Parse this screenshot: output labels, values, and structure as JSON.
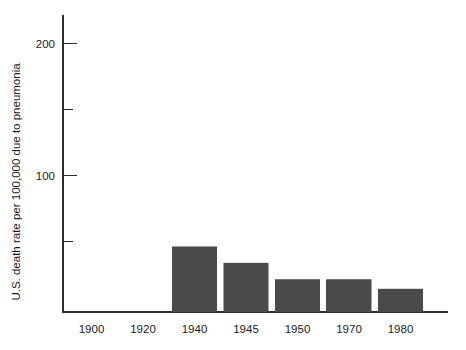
{
  "chart_data": {
    "type": "bar",
    "title": "",
    "subtitle": "",
    "xlabel": "",
    "ylabel": "U.S. death rate per 100,000 due to pneumonia",
    "categories": [
      "1900",
      "1920",
      "1940",
      "1945",
      "1950",
      "1970",
      "1980"
    ],
    "values": [
      162,
      102,
      48,
      36,
      24,
      24,
      17
    ],
    "series": [
      {
        "name": "U.S. death rate per 100,000 due to pneumonia",
        "values": [
          162,
          102,
          48,
          36,
          24,
          24,
          17
        ]
      }
    ],
    "ylim": [
      0,
      215
    ],
    "xlim_categories": 7,
    "y_major_ticks": [
      100,
      200
    ],
    "y_major_tick_labels": [
      "100",
      "200"
    ],
    "y_minor_ticks": [
      50,
      150
    ],
    "grid": false,
    "legend": false,
    "legend_position": "none",
    "bar_color": "#4a4a4a",
    "axis_color": "#2b2b2b",
    "background_color": "#ffffff",
    "annotations": []
  },
  "axes": {
    "y_axis_name": "y-axis",
    "x_axis_name": "x-axis"
  }
}
